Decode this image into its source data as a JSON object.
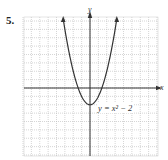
{
  "problem_number": "5.",
  "chart_data": {
    "type": "line",
    "title": "",
    "equation_label": "y = x² − 2",
    "xlabel": "x",
    "ylabel": "y",
    "grid": true,
    "xlim": [
      -8,
      8
    ],
    "ylim": [
      -8.5,
      8.5
    ],
    "series": [
      {
        "name": "y = x^2 - 2",
        "x": [
          -3.2,
          -3,
          -2.5,
          -2,
          -1.5,
          -1,
          -0.5,
          0,
          0.5,
          1,
          1.5,
          2,
          2.5,
          3,
          3.2
        ],
        "y": [
          8.24,
          7,
          4.25,
          2,
          0.25,
          -1,
          -1.75,
          -2,
          -1.75,
          -1,
          0.25,
          2,
          4.25,
          7,
          8.24
        ]
      }
    ],
    "vertex": [
      0,
      -2
    ],
    "colors": {
      "curve": "#333333",
      "axis": "#333333",
      "grid": "#bbbbbb"
    }
  }
}
